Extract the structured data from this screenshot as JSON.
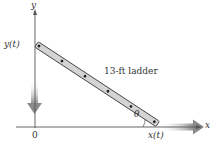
{
  "diagram": {
    "type": "related-rates ladder",
    "axes": {
      "y_label": "y",
      "x_label": "x",
      "origin_label": "0"
    },
    "labels": {
      "y_position": "y(t)",
      "x_position": "x(t)",
      "angle": "θ",
      "ladder": "13-ft ladder"
    },
    "ladder": {
      "length_ft": 13,
      "rung_count": 6
    },
    "arrows": {
      "vertical_motion": "down",
      "horizontal_motion": "right"
    },
    "colors": {
      "axis": "#555555",
      "ladder_fill": "#d4d4d4",
      "ladder_outline": "#444444",
      "motion_arrow": "#9a9a9a"
    }
  }
}
